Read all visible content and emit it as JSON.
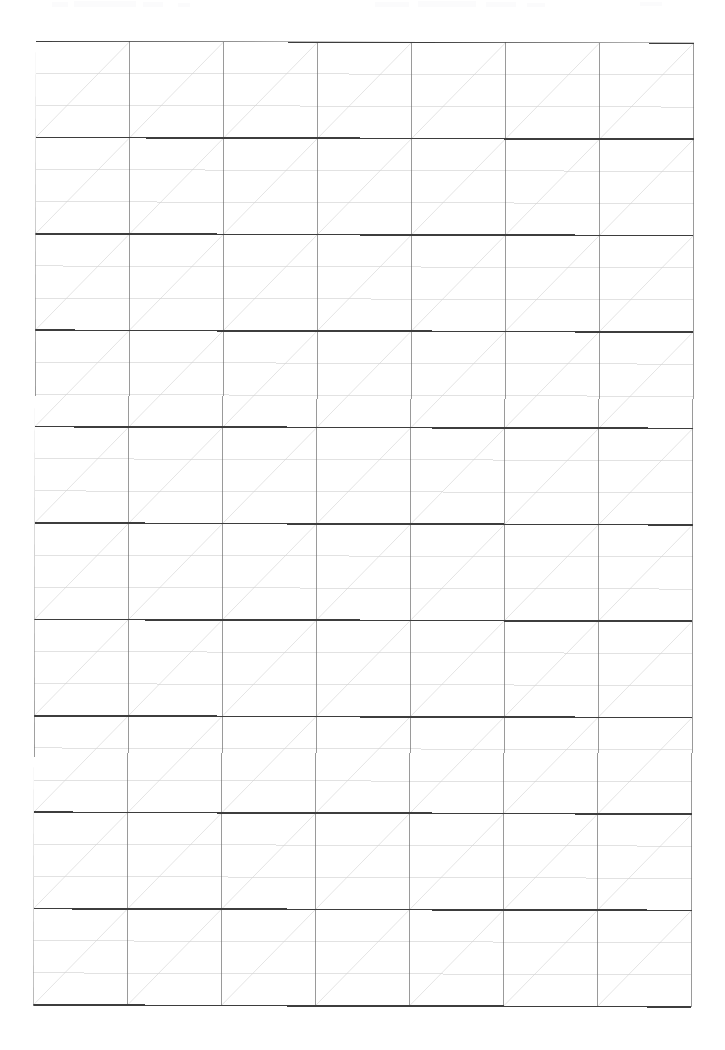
{
  "document": {
    "kind": "calligraphy-practice-grid",
    "title": "Blank Calligraphy Practice Sheet",
    "page_background": "#ffffff",
    "page_width": 725,
    "page_height": 1050,
    "text_content": [],
    "visible_labels": []
  },
  "grid": {
    "columns": 7,
    "rows": 10,
    "left": 36,
    "top": 41,
    "right": 694,
    "bottom": 1005,
    "cell_width": 94,
    "cell_height": 96.4,
    "sub_rows_per_row": 3,
    "diagonal_direction": "bottom-left-to-top-right",
    "diagonals_per_cell": 1,
    "skew_degrees": 0.16
  },
  "colors": {
    "page": "#ffffff",
    "major_line": "#3d3d3d",
    "column_line": "#6f6f6f",
    "guide_line": "#cfcfcf",
    "diagonal_line": "#d2d2d2",
    "artifact": "#fbfbfc"
  },
  "strokes": {
    "major_line_width": 1.6,
    "column_line_width": 0.7,
    "guide_line_width": 0.6,
    "diagonal_line_width": 0.6
  },
  "artifacts": [
    {
      "x": 52,
      "y": 2,
      "w": 16,
      "h": 5
    },
    {
      "x": 74,
      "y": 1,
      "w": 62,
      "h": 6
    },
    {
      "x": 143,
      "y": 2,
      "w": 20,
      "h": 5
    },
    {
      "x": 178,
      "y": 3,
      "w": 12,
      "h": 4
    },
    {
      "x": 375,
      "y": 2,
      "w": 34,
      "h": 5
    },
    {
      "x": 418,
      "y": 1,
      "w": 58,
      "h": 6
    },
    {
      "x": 486,
      "y": 2,
      "w": 30,
      "h": 5
    },
    {
      "x": 527,
      "y": 3,
      "w": 18,
      "h": 4
    },
    {
      "x": 640,
      "y": 2,
      "w": 22,
      "h": 4
    }
  ]
}
